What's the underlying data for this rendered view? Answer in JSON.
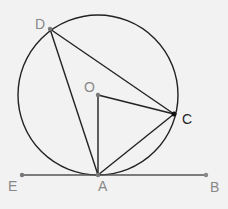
{
  "diagram": {
    "background": "#f2f2f2",
    "stroke_color": "#222222",
    "tangent_color": "#555555",
    "label_color": "#888888",
    "label_color_dark": "#222222",
    "circle": {
      "center": "O",
      "cx": 98,
      "cy": 95,
      "r": 80
    },
    "points": {
      "D": {
        "label": "D",
        "x": 50,
        "y": 29,
        "lx": 36,
        "ly": 28
      },
      "O": {
        "label": "O",
        "x": 98,
        "y": 95,
        "lx": 86,
        "ly": 91
      },
      "C": {
        "label": "C",
        "x": 174,
        "y": 114,
        "lx": 182,
        "ly": 123
      },
      "A": {
        "label": "A",
        "x": 98,
        "y": 175,
        "lx": 98,
        "ly": 191
      },
      "E": {
        "label": "E",
        "x": 22,
        "y": 175,
        "lx": 8,
        "ly": 191
      },
      "B": {
        "label": "B",
        "x": 206,
        "y": 175,
        "lx": 211,
        "ly": 192
      }
    },
    "segments": [
      "DA",
      "DC",
      "OA",
      "OC",
      "AC",
      "EB"
    ]
  }
}
